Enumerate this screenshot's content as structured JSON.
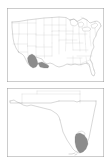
{
  "figure": {
    "title": "",
    "background_color": "#ffffff",
    "width": 111,
    "height": 166,
    "panel_count": 2
  },
  "colors": {
    "frame_stroke": "#9a9a9a",
    "coastline_stroke": "#6e6e6e",
    "state_border_stroke": "#b4b4b4",
    "shaded_region_fill": "#8c8c8c",
    "shaded_region_stroke": "#6e6e6e",
    "water_fill": "#ffffff",
    "page_background": "#ffffff"
  },
  "panels": [
    {
      "id": "panel-top",
      "label": "",
      "map_name": "continental-united-states",
      "description": "Outline map of the conterminous United States with state boundaries",
      "features": [
        "national-coastline",
        "state-boundaries",
        "great-lakes",
        "gulf-of-mexico-coast"
      ],
      "shaded_regions": [
        {
          "name": "study-area-gulf-coast",
          "fill": "#8c8c8c",
          "location": "south-central-gulf-coast"
        }
      ],
      "frame": {
        "left": 7,
        "top": 8,
        "width": 97,
        "height": 74,
        "stroke": "#9a9a9a"
      }
    },
    {
      "id": "panel-bottom",
      "label": "",
      "map_name": "florida",
      "description": "Outline map of Florida peninsula and panhandle with adjacent state borders",
      "features": [
        "florida-coastline",
        "state-boundaries",
        "florida-keys",
        "lake-okeechobee"
      ],
      "shaded_regions": [
        {
          "name": "study-area-everglades",
          "fill": "#8c8c8c",
          "location": "southeast-florida"
        }
      ],
      "frame": {
        "left": 7,
        "top": 88,
        "width": 97,
        "height": 69,
        "stroke": "#9a9a9a"
      }
    }
  ],
  "legend": {
    "visible": false,
    "entries": []
  },
  "axis_labels": {
    "visible": false,
    "x": "",
    "y": ""
  }
}
